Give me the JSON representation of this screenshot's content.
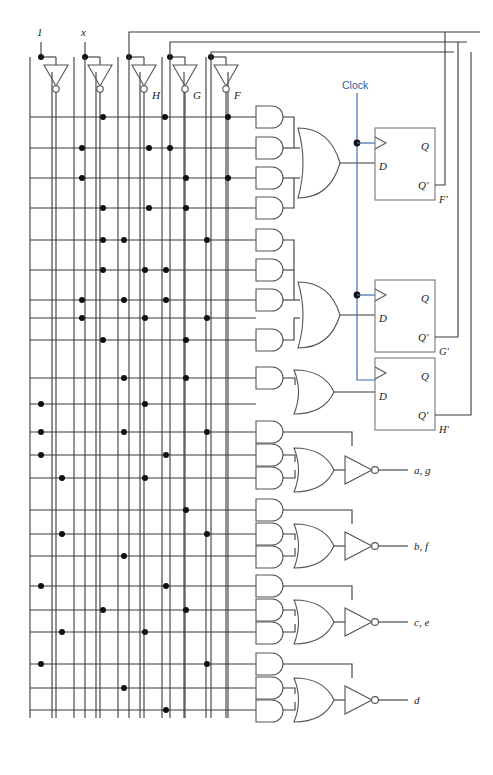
{
  "diagram": {
    "colors": {
      "wire": "#3a3a3a",
      "gate": "#555555",
      "flipflop_box": "#777777",
      "clock": "#3f6fa8",
      "dot": "#111111",
      "background": "#ffffff"
    }
  },
  "inputs": [
    {
      "name": "constant-one",
      "label": "1",
      "x": 41
    },
    {
      "name": "input-x",
      "label": "x",
      "x": 85
    }
  ],
  "inverters": [
    {
      "name": "inverter-1",
      "label": "",
      "x": 41
    },
    {
      "name": "inverter-x",
      "label": "",
      "x": 85
    },
    {
      "name": "inverter-h",
      "label": "H",
      "x": 142
    },
    {
      "name": "inverter-g",
      "label": "G",
      "x": 183
    },
    {
      "name": "inverter-f",
      "label": "F",
      "x": 224
    }
  ],
  "clock": {
    "label": "Clock",
    "x": 357,
    "label_x": 348,
    "label_y": 88
  },
  "flipflops": [
    {
      "name": "flipflop-f",
      "d_label": "D",
      "q_label": "Q",
      "qbar_label": "Q'",
      "out_label": "F'"
    },
    {
      "name": "flipflop-g",
      "d_label": "D",
      "q_label": "Q",
      "qbar_label": "Q'",
      "out_label": "G'"
    },
    {
      "name": "flipflop-h",
      "d_label": "D",
      "q_label": "Q",
      "qbar_label": "Q'",
      "out_label": "H'"
    }
  ],
  "outputs": [
    {
      "name": "output-a-g",
      "label": "a, g",
      "y": 470
    },
    {
      "name": "output-b-f",
      "label": "b, f",
      "y": 546
    },
    {
      "name": "output-c-e",
      "label": "c, e",
      "y": 622
    },
    {
      "name": "output-d",
      "label": "d",
      "y": 700
    }
  ],
  "gate_groups": [
    {
      "name": "and-group-f",
      "and_count": 4,
      "or_inputs": 4
    },
    {
      "name": "and-group-g",
      "and_count": 4,
      "or_inputs": 4
    },
    {
      "name": "and-group-h",
      "and_count": 1,
      "or_inputs": 1
    },
    {
      "name": "and-group-ag",
      "and_count": 2,
      "or_inputs": 2
    },
    {
      "name": "and-group-bf",
      "and_count": 2,
      "or_inputs": 2
    },
    {
      "name": "and-group-ce",
      "and_count": 2,
      "or_inputs": 2
    },
    {
      "name": "and-group-d",
      "and_count": 2,
      "or_inputs": 2
    }
  ],
  "bus": {
    "vertical_line_count": 10,
    "vertical_x": [
      30,
      52,
      74,
      96,
      118,
      140,
      162,
      184,
      206,
      228
    ],
    "horizontal_row_count": 20
  }
}
